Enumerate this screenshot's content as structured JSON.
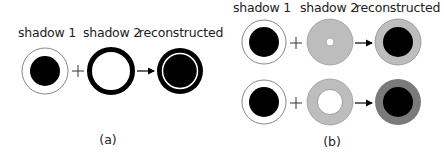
{
  "panel_a": {
    "labels": {
      "shadow1": "shadow 1",
      "shadow2": "shadow 2",
      "reconstructed": "reconstructed"
    },
    "caption": "(a)"
  },
  "panel_b": {
    "labels": {
      "shadow1": "shadow 1",
      "shadow2": "shadow 2",
      "reconstructed": "reconstructed"
    },
    "caption": "(b)"
  },
  "operators": {
    "plus": "+",
    "arrow": "→"
  },
  "colors": {
    "black": "#000000",
    "light_gray": "#bdbdbd",
    "dark_gray": "#7a7a7a",
    "outline": "#555555"
  }
}
